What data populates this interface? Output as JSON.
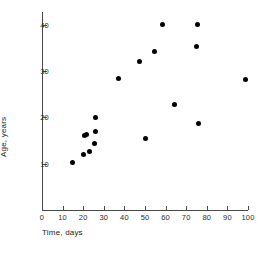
{
  "chart_data": {
    "type": "scatter",
    "title": "",
    "xlabel": "Time, days",
    "ylabel": "Age, years",
    "xlim": [
      0,
      100
    ],
    "ylim": [
      0,
      42.8
    ],
    "xticks": [
      0,
      10,
      20,
      30,
      40,
      50,
      60,
      70,
      80,
      90,
      100
    ],
    "xticklabels": [
      "0",
      "10",
      "20",
      "30",
      "40",
      "50",
      "60",
      "70",
      "80",
      "90",
      "100"
    ],
    "yticks": [
      10,
      20,
      30,
      40
    ],
    "yticklabels": [
      "10",
      "20",
      "30",
      "40"
    ],
    "grid": false,
    "legend": null,
    "marker": "filled-circle",
    "marker_color": "#000000",
    "axis_color": "#4a4a4a",
    "background_color": "#ffffff",
    "points": [
      {
        "x": 15.0,
        "y": 10.2
      },
      {
        "x": 20.2,
        "y": 12.0
      },
      {
        "x": 20.5,
        "y": 16.1
      },
      {
        "x": 21.5,
        "y": 16.3
      },
      {
        "x": 23.0,
        "y": 12.6
      },
      {
        "x": 25.8,
        "y": 17.0
      },
      {
        "x": 25.5,
        "y": 14.3
      },
      {
        "x": 26.2,
        "y": 20.0
      },
      {
        "x": 37.2,
        "y": 28.5
      },
      {
        "x": 47.5,
        "y": 32.1
      },
      {
        "x": 50.2,
        "y": 15.4
      },
      {
        "x": 54.5,
        "y": 34.3
      },
      {
        "x": 58.5,
        "y": 40.2
      },
      {
        "x": 64.2,
        "y": 22.7
      },
      {
        "x": 75.0,
        "y": 35.4
      },
      {
        "x": 75.5,
        "y": 40.2
      },
      {
        "x": 76.0,
        "y": 18.6
      },
      {
        "x": 99.0,
        "y": 28.2
      }
    ]
  }
}
